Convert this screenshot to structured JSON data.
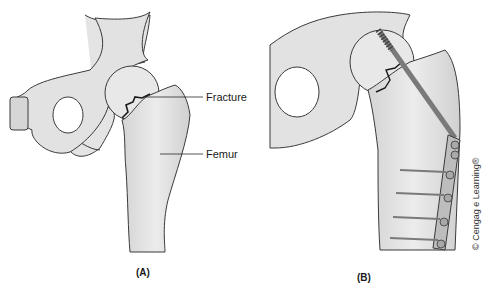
{
  "figure": {
    "panels": [
      {
        "id": "A",
        "caption": "(A)",
        "labels": {
          "fracture": "Fracture",
          "femur": "Femur"
        }
      },
      {
        "id": "B",
        "caption": "(B)"
      }
    ],
    "copyright": "© Cengag e Learning®"
  },
  "colors": {
    "bone_fill": "#e6e6e6",
    "bone_shade": "#cfcfcf",
    "outline": "#3a3a3a",
    "hardware": "#9a9a9a"
  }
}
